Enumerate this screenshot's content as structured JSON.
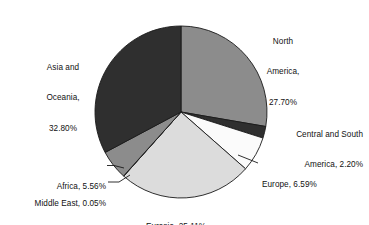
{
  "chart_data": {
    "type": "pie",
    "title": "",
    "subtitle": "",
    "xlabel": "",
    "ylabel": "",
    "legend_position": "none",
    "grid": false,
    "units": "percent",
    "start_angle_deg": 0,
    "direction": "clockwise",
    "categories": [
      "North America",
      "Central and South America",
      "Europe",
      "Eurasia",
      "Middle East",
      "Africa",
      "Asia and Oceania"
    ],
    "values": [
      27.7,
      2.2,
      6.59,
      25.11,
      0.05,
      5.56,
      32.8
    ],
    "slices": [
      {
        "name": "North America",
        "value": 27.7,
        "value_text": "27.70%",
        "color": "#8c8c8c",
        "label_lines": [
          "North",
          "America,",
          "27.70%"
        ],
        "leader_line": false
      },
      {
        "name": "Central and South America",
        "value": 2.2,
        "value_text": "2.20%",
        "color": "#2f2f2f",
        "label_lines": [
          "Central and South",
          "America, 2.20%"
        ],
        "leader_line": false
      },
      {
        "name": "Europe",
        "value": 6.59,
        "value_text": "6.59%",
        "color": "#fbfbfb",
        "label_lines": [
          "Europe, 6.59%"
        ],
        "leader_line": true
      },
      {
        "name": "Eurasia",
        "value": 25.11,
        "value_text": "25.11%",
        "color": "#dcdcdc",
        "label_lines": [
          "Eurasia, 25.11%"
        ],
        "leader_line": false
      },
      {
        "name": "Middle East",
        "value": 0.05,
        "value_text": "0.05%",
        "color": "#8c8c8c",
        "label_lines": [
          "Middle East, 0.05%"
        ],
        "leader_line": true
      },
      {
        "name": "Africa",
        "value": 5.56,
        "value_text": "5.56%",
        "color": "#8c8c8c",
        "label_lines": [
          "Africa, 5.56%"
        ],
        "leader_line": true
      },
      {
        "name": "Asia and Oceania",
        "value": 32.8,
        "value_text": "32.80%",
        "color": "#2f2f2f",
        "label_lines": [
          "Asia and",
          "Oceania,",
          "32.80%"
        ],
        "leader_line": false
      }
    ]
  },
  "labels": {
    "north_america": {
      "l1": "North",
      "l2": "America,",
      "l3": "27.70%"
    },
    "asia_oceania": {
      "l1": "Asia and",
      "l2": "Oceania,",
      "l3": "32.80%"
    },
    "central_south_america": {
      "l1": "Central and South",
      "l2": "America, 2.20%"
    },
    "europe": {
      "l1": "Europe, 6.59%"
    },
    "africa": {
      "l1": "Africa, 5.56%"
    },
    "middle_east": {
      "l1": "Middle East, 0.05%"
    },
    "eurasia": {
      "l1": "Eurasia, 25.11%"
    }
  },
  "geometry": {
    "center_x": 181,
    "center_y": 112,
    "radius": 86
  },
  "colors": {
    "background": "#ffffff",
    "outline": "#1a1a1a",
    "text": "#111111",
    "dark_slice": "#2f2f2f",
    "mid_slice": "#8c8c8c",
    "light_slice": "#dcdcdc",
    "white_slice": "#fbfbfb"
  }
}
